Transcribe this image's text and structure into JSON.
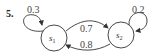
{
  "problem": {
    "number": "5."
  },
  "states": [
    {
      "id": "s1",
      "name": "s",
      "subscript": "1"
    },
    {
      "id": "s2",
      "name": "s",
      "subscript": "2"
    }
  ],
  "transitions": [
    {
      "from": "s1",
      "to": "s1",
      "prob": "0.3"
    },
    {
      "from": "s1",
      "to": "s2",
      "prob": "0.7"
    },
    {
      "from": "s2",
      "to": "s1",
      "prob": "0.8"
    },
    {
      "from": "s2",
      "to": "s2",
      "prob": "0.2"
    }
  ],
  "colors": {
    "stroke": "#333333",
    "text": "#444444",
    "background": "#ffffff"
  }
}
